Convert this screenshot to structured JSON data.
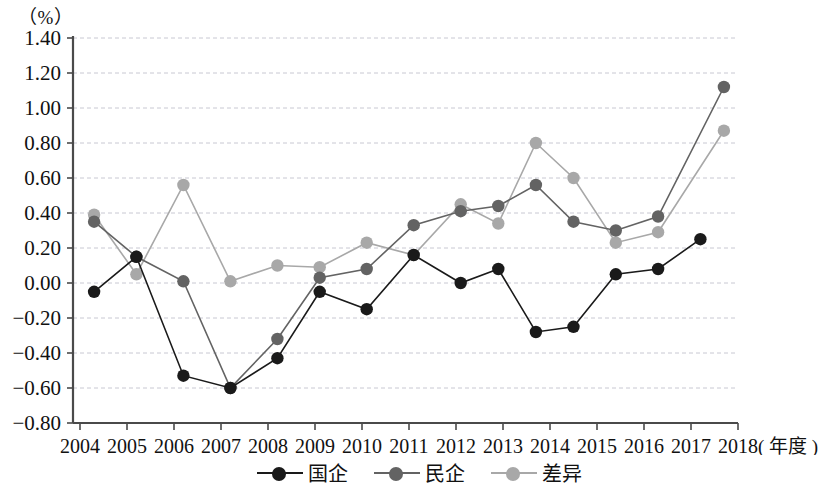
{
  "axis": {
    "unit_top": "（%）",
    "unit_x": "( 年度 )"
  },
  "legend": {
    "items": [
      {
        "label": "国企",
        "color": "#1a1a1a"
      },
      {
        "label": "民企",
        "color": "#636363"
      },
      {
        "label": "差异",
        "color": "#a8a8a8"
      }
    ]
  },
  "chart_data": {
    "type": "line",
    "title": "",
    "xlabel": "( 年度 )",
    "ylabel": "（%）",
    "xlim": [
      2004,
      2018
    ],
    "ylim": [
      -0.8,
      1.4
    ],
    "ytick_labels": [
      "1.40",
      "1.20",
      "1.00",
      "0.80",
      "0.60",
      "0.40",
      "0.20",
      "0.00",
      "-0.20",
      "-0.40",
      "-0.60",
      "-0.80"
    ],
    "ytick_values": [
      1.4,
      1.2,
      1.0,
      0.8,
      0.6,
      0.4,
      0.2,
      0.0,
      -0.2,
      -0.4,
      -0.6,
      -0.8
    ],
    "xtick_labels": [
      "2004",
      "2005",
      "2006",
      "2007",
      "2008",
      "2009",
      "2010",
      "2011",
      "2012",
      "2013",
      "2014",
      "2015",
      "2016",
      "2017",
      "2018"
    ],
    "xtick_values": [
      2004,
      2005,
      2006,
      2007,
      2008,
      2009,
      2010,
      2011,
      2012,
      2013,
      2014,
      2015,
      2016,
      2017,
      2018
    ],
    "grid": true,
    "legend_position": "bottom",
    "series": [
      {
        "name": "国企",
        "color": "#1a1a1a",
        "x": [
          2004.3,
          2005.2,
          2006.2,
          2007.2,
          2008.2,
          2009.1,
          2010.1,
          2011.1,
          2012.1,
          2012.9,
          2013.7,
          2014.5,
          2015.4,
          2016.3,
          2017.2
        ],
        "values": [
          -0.05,
          0.15,
          -0.53,
          -0.6,
          -0.43,
          -0.05,
          -0.15,
          0.16,
          0.0,
          0.08,
          -0.28,
          -0.25,
          0.05,
          0.08,
          0.25
        ]
      },
      {
        "name": "民企",
        "color": "#636363",
        "x": [
          2004.3,
          2005.2,
          2006.2,
          2007.2,
          2008.2,
          2009.1,
          2010.1,
          2011.1,
          2012.1,
          2012.9,
          2013.7,
          2014.5,
          2015.4,
          2016.3,
          2017.7
        ],
        "values": [
          0.35,
          0.15,
          0.01,
          -0.6,
          -0.32,
          0.03,
          0.08,
          0.33,
          0.41,
          0.44,
          0.56,
          0.35,
          0.3,
          0.38,
          1.12
        ]
      },
      {
        "name": "差异",
        "color": "#a8a8a8",
        "x": [
          2004.3,
          2005.2,
          2006.2,
          2007.2,
          2008.2,
          2009.1,
          2010.1,
          2011.1,
          2012.1,
          2012.9,
          2013.7,
          2014.5,
          2015.4,
          2016.3,
          2017.7
        ],
        "values": [
          0.39,
          0.05,
          0.56,
          0.01,
          0.1,
          0.09,
          0.23,
          0.16,
          0.45,
          0.34,
          0.8,
          0.6,
          0.23,
          0.29,
          0.87
        ]
      }
    ]
  },
  "geometry": {
    "plot_left": 73,
    "plot_right": 770,
    "plot_top": 38,
    "plot_bottom": 423,
    "x_first_tick": 80,
    "x_tick_step": 47.0
  }
}
